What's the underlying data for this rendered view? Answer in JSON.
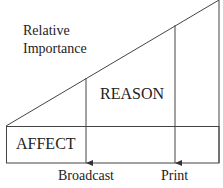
{
  "diagram": {
    "axis_label_line1": "Relative",
    "axis_label_line2": "Importance",
    "region_upper": "REASON",
    "region_lower": "AFFECT",
    "media": [
      {
        "label": "Broadcast"
      },
      {
        "label": "Print"
      }
    ],
    "line_color": "#333333"
  }
}
